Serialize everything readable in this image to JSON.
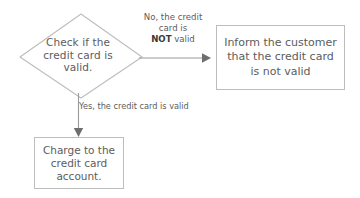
{
  "diagram": {
    "type": "flowchart",
    "decision": {
      "shape": "diamond",
      "text": "Check if the\ncredit card is\nvalid."
    },
    "edges": {
      "no_branch": {
        "line1": "No, the credit",
        "line2": "card is",
        "line3_bold": "NOT",
        "line3_rest": " valid",
        "direction": "right"
      },
      "yes_branch": {
        "label": "Yes, the credit card is valid",
        "direction": "down"
      }
    },
    "boxes": {
      "inform": {
        "shape": "rectangle",
        "text": "Inform the customer\nthat the credit card\nis not valid"
      },
      "charge": {
        "shape": "rectangle",
        "text": "Charge to the\ncredit card\naccount."
      }
    },
    "colors": {
      "stroke": "#bdbdbd",
      "text": "#5c5c5c",
      "bold_text": "#3a3a3a",
      "background": "#ffffff"
    }
  }
}
